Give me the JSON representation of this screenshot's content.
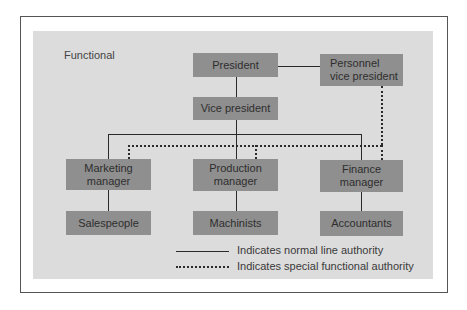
{
  "diagram": {
    "title": "Functional",
    "nodes": {
      "president": "President",
      "personnel_vp_line1": "Personnel",
      "personnel_vp_line2": "vice president",
      "vice_president": "Vice president",
      "marketing_line1": "Marketing",
      "marketing_line2": "manager",
      "production_line1": "Production",
      "production_line2": "manager",
      "finance_line1": "Finance",
      "finance_line2": "manager",
      "salespeople": "Salespeople",
      "machinists": "Machinists",
      "accountants": "Accountants"
    },
    "edges": [
      {
        "from": "President",
        "to": "Personnel vice president",
        "type": "solid"
      },
      {
        "from": "President",
        "to": "Vice president",
        "type": "solid"
      },
      {
        "from": "Vice president",
        "to": "Marketing manager",
        "type": "solid"
      },
      {
        "from": "Vice president",
        "to": "Production manager",
        "type": "solid"
      },
      {
        "from": "Vice president",
        "to": "Finance manager",
        "type": "solid"
      },
      {
        "from": "Marketing manager",
        "to": "Salespeople",
        "type": "solid"
      },
      {
        "from": "Production manager",
        "to": "Machinists",
        "type": "solid"
      },
      {
        "from": "Finance manager",
        "to": "Accountants",
        "type": "solid"
      },
      {
        "from": "Personnel vice president",
        "to": "Marketing manager",
        "type": "dotted"
      },
      {
        "from": "Personnel vice president",
        "to": "Production manager",
        "type": "dotted"
      },
      {
        "from": "Personnel vice president",
        "to": "Finance manager",
        "type": "dotted"
      }
    ],
    "legend": {
      "solid": "Indicates normal line authority",
      "dotted": "Indicates special functional authority"
    }
  }
}
